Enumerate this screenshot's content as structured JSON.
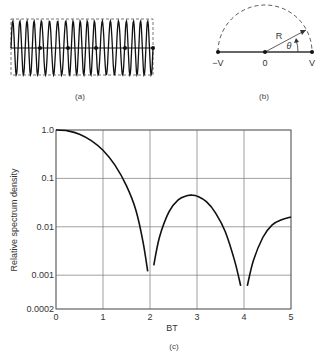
{
  "panel_a": {
    "caption": "(a)",
    "dot_x": [
      40,
      68,
      96,
      125,
      153
    ]
  },
  "panel_b": {
    "caption": "(b)",
    "labels": {
      "left": "−V",
      "center": "0",
      "right": "V",
      "radius": "R",
      "angle": "θ"
    }
  },
  "chart_data": {
    "type": "line",
    "title": "",
    "caption": "(c)",
    "xlabel": "BT",
    "ylabel": "Relative spectrum density",
    "xscale": "linear",
    "yscale": "log",
    "xlim": [
      0,
      5
    ],
    "ylim": [
      0.0002,
      1.0
    ],
    "x_ticks": [
      "0",
      "1",
      "2",
      "3",
      "4",
      "5"
    ],
    "y_ticks": [
      "1.0",
      "0.1",
      "0.01",
      "0.001",
      "0.0002"
    ],
    "grid": true,
    "series": [
      {
        "name": "Relative spectrum density",
        "segments": [
          {
            "x": [
              0,
              0.25,
              0.5,
              0.75,
              1.0,
              1.25,
              1.5,
              1.7,
              1.85,
              1.95
            ],
            "y": [
              1.0,
              0.96,
              0.82,
              0.6,
              0.38,
              0.19,
              0.07,
              0.022,
              0.005,
              0.0012
            ]
          },
          {
            "x": [
              2.08,
              2.2,
              2.4,
              2.6,
              2.8,
              2.9,
              3.0,
              3.2,
              3.4,
              3.6,
              3.8,
              3.93
            ],
            "y": [
              0.0016,
              0.006,
              0.02,
              0.036,
              0.044,
              0.045,
              0.043,
              0.033,
              0.019,
              0.008,
              0.002,
              0.0006
            ]
          },
          {
            "x": [
              4.07,
              4.2,
              4.4,
              4.6,
              4.8,
              5.0
            ],
            "y": [
              0.0006,
              0.002,
              0.006,
              0.011,
              0.014,
              0.016
            ]
          }
        ]
      }
    ]
  }
}
